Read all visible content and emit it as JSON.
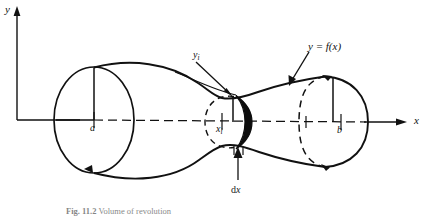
{
  "figure": {
    "type": "math-illustration",
    "background_color": "#ffffff",
    "stroke_color": "#111111",
    "axes": {
      "y_label": "y",
      "x_label": "x",
      "origin_x": 17,
      "origin_y": 120,
      "y_axis_top": 8,
      "x_axis_end": 405
    },
    "labels": {
      "lower_limit": "a",
      "upper_limit": "b",
      "sample_point": "x",
      "sample_point_sub": "i",
      "sample_height": "y",
      "sample_height_sub": "i",
      "function": "y = f(x)",
      "thickness_d": "d",
      "thickness_x": "x"
    },
    "caption": {
      "figure_number": "Fig. 11.2",
      "text": "Volume of revolution"
    },
    "geometry": {
      "left_disk_center_x": 94,
      "left_disk_center_y": 120,
      "left_disk_rx": 40,
      "left_disk_ry": 53,
      "slab_center_x": 222,
      "slab_center_y": 122,
      "slab_rx": 17,
      "slab_ry": 28,
      "right_disk_center_x": 325,
      "right_disk_center_y": 122,
      "right_disk_rx": 20,
      "right_disk_ry": 35
    }
  }
}
